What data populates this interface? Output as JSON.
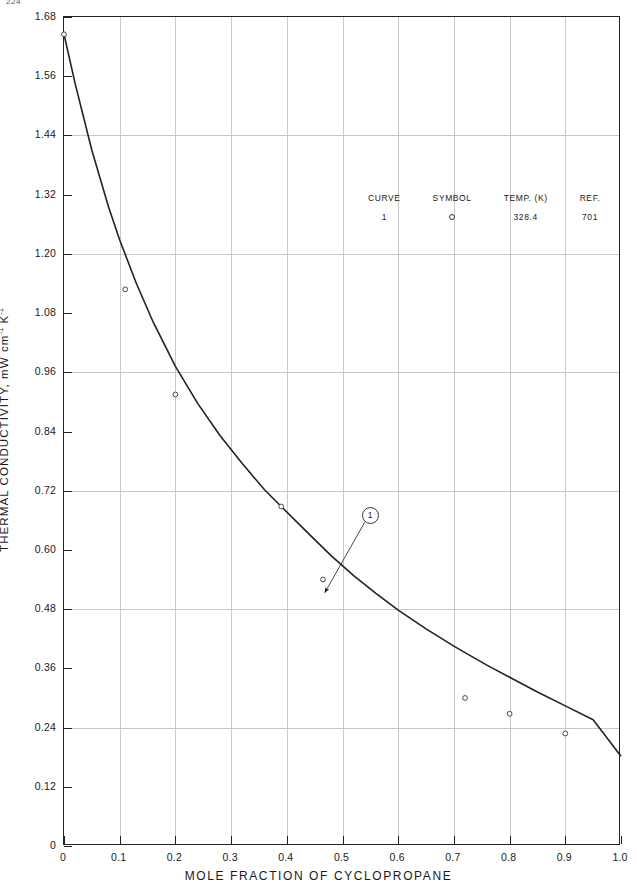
{
  "page": {
    "clipped_header_text": "224"
  },
  "axes": {
    "y_title_main": "THERMAL CONDUCTIVITY, mW cm",
    "y_title_sup1": "-1",
    "y_title_mid": " K",
    "y_title_sup2": "-1",
    "y_ticks": [
      "0",
      "0.12",
      "0.24",
      "0.36",
      "0.48",
      "0.60",
      "0.72",
      "0.84",
      "0.96",
      "1.08",
      "1.20",
      "1.32",
      "1.44",
      "1.56",
      "1.68"
    ],
    "y_tick_values": [
      0,
      0.12,
      0.24,
      0.36,
      0.48,
      0.6,
      0.72,
      0.84,
      0.96,
      1.08,
      1.2,
      1.32,
      1.44,
      1.56,
      1.68
    ],
    "x_title": "MOLE FRACTION OF CYCLOPROPANE",
    "x_ticks": [
      "0",
      "0.1",
      "0.2",
      "0.3",
      "0.4",
      "0.5",
      "0.6",
      "0.7",
      "0.8",
      "0.9",
      "1.0"
    ],
    "x_tick_values": [
      0,
      0.1,
      0.2,
      0.3,
      0.4,
      0.5,
      0.6,
      0.7,
      0.8,
      0.9,
      1.0
    ]
  },
  "legend": {
    "headers": [
      "CURVE",
      "SYMBOL",
      "TEMP. (K)",
      "REF."
    ],
    "rows": [
      {
        "curve": "1",
        "symbol": "circle-marker",
        "temp": "328.4",
        "ref": "701"
      }
    ]
  },
  "annotation": {
    "label": "1",
    "circle_x": 0.548,
    "circle_y": 0.672,
    "arrow_tip_x": 0.468,
    "arrow_tip_y": 0.513
  },
  "chart_data": {
    "type": "line",
    "title": "",
    "xlabel": "MOLE FRACTION OF CYCLOPROPANE",
    "ylabel": "THERMAL CONDUCTIVITY, mW cm-1 K-1",
    "xlim": [
      0,
      1.0
    ],
    "ylim": [
      0,
      1.68
    ],
    "grid": true,
    "legend_position": "upper-center",
    "series": [
      {
        "name": "Curve 1 — 328.4 K (Ref. 701)",
        "symbol": "open-circle",
        "temperature_K": 328.4,
        "reference": 701,
        "curve_x": [
          0.0,
          0.02,
          0.05,
          0.08,
          0.1,
          0.13,
          0.16,
          0.2,
          0.24,
          0.28,
          0.32,
          0.36,
          0.39,
          0.44,
          0.48,
          0.52,
          0.56,
          0.6,
          0.65,
          0.7,
          0.72,
          0.76,
          0.8,
          0.85,
          0.9,
          0.95,
          1.0
        ],
        "curve_y": [
          1.645,
          1.545,
          1.41,
          1.295,
          1.228,
          1.14,
          1.062,
          0.972,
          0.897,
          0.832,
          0.775,
          0.722,
          0.688,
          0.632,
          0.588,
          0.548,
          0.512,
          0.478,
          0.44,
          0.405,
          0.392,
          0.366,
          0.342,
          0.312,
          0.284,
          0.256,
          0.182
        ],
        "points_x": [
          0.0,
          0.11,
          0.2,
          0.39,
          0.465,
          0.72,
          0.8,
          0.9
        ],
        "points_y": [
          1.645,
          1.128,
          0.915,
          0.688,
          0.54,
          0.3,
          0.268,
          0.228
        ]
      }
    ]
  }
}
